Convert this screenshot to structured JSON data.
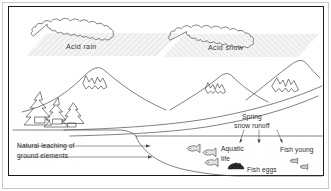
{
  "figure": {
    "background_color": "#ffffff",
    "line_color": "#4a4a4a",
    "frame_color": "#1a1a1a",
    "band_fill_color": "#f0f0f0",
    "hatch_color": "#d6d6d6"
  },
  "labels": {
    "acid_rain": "Acid rain",
    "acid_snow": "Acid snow",
    "natural_leaching_line1": "Natural leaching of",
    "natural_leaching_line2": "ground elements",
    "spring_runoff_line1": "Spring",
    "spring_runoff_line2": "snow runoff",
    "aquatic_line1": "Aquatic",
    "aquatic_line2": "life",
    "fish_eggs": "Fish eggs",
    "fish_young": "Fish young"
  },
  "icons": {
    "cloud_left": "cloud-icon",
    "cloud_right": "cloud-icon",
    "tree_left": "pine-tree-icon",
    "tree_center": "pine-tree-icon",
    "tree_right": "pine-tree-icon",
    "mountain_left": "snow-capped-mountain-icon",
    "mountain_mid": "snow-capped-mountain-icon",
    "mountain_right": "snow-capped-mountain-icon",
    "fish_1": "fish-icon",
    "fish_2": "fish-icon",
    "fish_3": "fish-icon",
    "eggs": "fish-eggs-icon",
    "fry_1": "fish-fry-icon",
    "fry_2": "fish-fry-icon",
    "arrow_leaching_upper": "arrow-right-icon",
    "arrow_leaching_lower": "arrow-right-icon",
    "arrow_runoff_left": "arrow-down-icon",
    "arrow_runoff_center": "arrow-down-icon",
    "arrow_runoff_right": "arrow-down-icon"
  }
}
